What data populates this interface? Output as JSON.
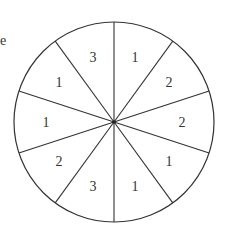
{
  "stray_text": "e",
  "spinner": {
    "sector_count": 10,
    "labels_clockwise_from_top": [
      "1",
      "2",
      "2",
      "1",
      "1",
      "3",
      "2",
      "1",
      "1",
      "3"
    ],
    "line_color": "#333333",
    "background": "#ffffff"
  }
}
